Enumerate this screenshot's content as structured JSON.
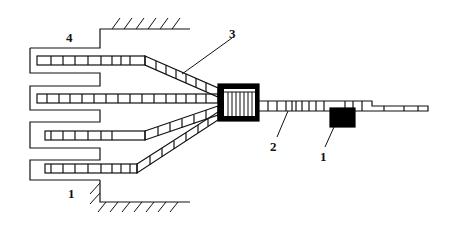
{
  "diagram": {
    "type": "schematic",
    "colors": {
      "stroke": "#111111",
      "fill_block": "#000000",
      "background": "#ffffff"
    },
    "labels": [
      {
        "id": "label-4",
        "text": "4",
        "x": 66,
        "y": 33
      },
      {
        "id": "label-3",
        "text": "3",
        "x": 230,
        "y": 28
      },
      {
        "id": "label-2",
        "text": "2",
        "x": 270,
        "y": 144
      },
      {
        "id": "label-1-right",
        "text": "1",
        "x": 320,
        "y": 151
      },
      {
        "id": "label-1-left",
        "text": "1",
        "x": 68,
        "y": 190
      }
    ],
    "components": [
      "comb-shaped enclosure with 4 fingers",
      "4 segmented chains (branches)",
      "central square block with vertical slats",
      "segmented output strip",
      "black rectangular block",
      "hatched fixed walls (top and bottom)"
    ]
  }
}
